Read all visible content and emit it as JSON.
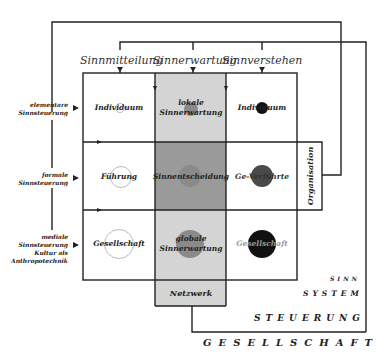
{
  "diagram": {
    "column_headers": [
      "Sinnmitteilung",
      "Sinnerwartung",
      "Sinnverstehen"
    ],
    "row_labels": [
      {
        "lines": [
          "elementare",
          "Sinnsteuerung"
        ]
      },
      {
        "lines": [
          "formale",
          "Sinnsteuerung"
        ]
      },
      {
        "lines": [
          "mediale",
          "Sinnsteuerung",
          "Kultur als",
          "Anthropotechnik"
        ]
      }
    ],
    "cells": [
      {
        "row": 0,
        "col": 0,
        "lines": [
          "Individuum"
        ],
        "circle": "small-outline",
        "fill": "#ffffff"
      },
      {
        "row": 0,
        "col": 1,
        "lines": [
          "lokale",
          "Sinnerwartung"
        ],
        "circle": "small-gray",
        "fill": "#d4d4d4"
      },
      {
        "row": 0,
        "col": 2,
        "lines": [
          "Individuum"
        ],
        "circle": "small-black",
        "fill": "#ffffff"
      },
      {
        "row": 1,
        "col": 0,
        "lines": [
          "Führung"
        ],
        "circle": "medium-outline",
        "fill": "#ffffff"
      },
      {
        "row": 1,
        "col": 1,
        "lines": [
          "Sinnentscheidung"
        ],
        "circle": "medium-gray",
        "fill": "#9a9a9a"
      },
      {
        "row": 1,
        "col": 2,
        "lines": [
          "Ge-Verführte"
        ],
        "circle": "medium-darkgray",
        "fill": "#ffffff"
      },
      {
        "row": 2,
        "col": 0,
        "lines": [
          "Gesellschaft"
        ],
        "circle": "large-outline",
        "fill": "#ffffff"
      },
      {
        "row": 2,
        "col": 1,
        "lines": [
          "globale",
          "Sinnerwartung"
        ],
        "circle": "large-gray",
        "fill": "#d4d4d4"
      },
      {
        "row": 2,
        "col": 2,
        "lines": [
          "Gesellschaft"
        ],
        "circle": "large-black",
        "fill": "#ffffff"
      }
    ],
    "extension_boxes": {
      "bottom": "Netzwerk",
      "right": "Organisation"
    },
    "tiers": [
      "SINN",
      "SYSTEM",
      "STEUERUNG",
      "GESELLSCHAFT"
    ],
    "colors": {
      "line": "#222222",
      "light_gray": "#d4d4d4",
      "mid_gray": "#9a9a9a",
      "circle_gray": "#8a8a8a",
      "circle_dark": "#4a4a4a",
      "circle_black": "#111111",
      "circle_outline": "#bbbbbb"
    }
  }
}
